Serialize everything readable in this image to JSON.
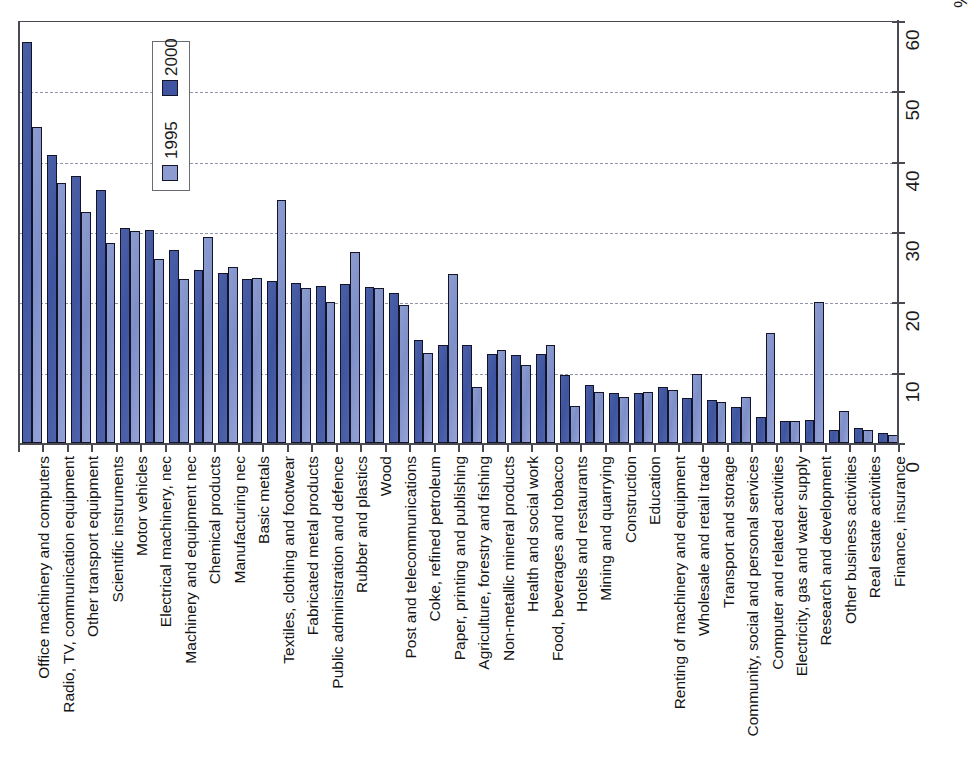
{
  "chart_data": {
    "type": "bar",
    "title": "",
    "xlabel": "",
    "ylabel": "%",
    "unit_label": "%",
    "ylim": [
      0,
      60
    ],
    "yticks": [
      0,
      10,
      20,
      30,
      40,
      50,
      60
    ],
    "grid": true,
    "grid_style": "dashed horizontal gridlines at 10,20,30,40,50",
    "orientation": "vertical bars, rotated page (category labels read bottom-to-top)",
    "legend_position": "inside plot, upper-left area",
    "legend": [
      "2000",
      "1995"
    ],
    "colors": {
      "series_2000": "#3e54a0",
      "series_1995": "#8c9cd0",
      "axis": "#4a4a52",
      "gridline": "#8f94a8",
      "background": "#ffffff"
    },
    "categories": [
      "Office machinery and computers",
      "Radio, TV, communication equipment",
      "Other transport equipment",
      "Scientific instruments",
      "Motor vehicles",
      "Electrical machinery, nec",
      "Machinery and equipment nec",
      "Chemical products",
      "Manufacturing nec",
      "Basic metals",
      "Textiles, clothing and footwear",
      "Fabricated metal products",
      "Public administration and defence",
      "Rubber and plastics",
      "Wood",
      "Post and telecommunications",
      "Coke, refined petroleum",
      "Paper, printing and publishing",
      "Agriculture, forestry and fishing",
      "Non-metallic mineral products",
      "Health and social work",
      "Food, beverages and tobacco",
      "Hotels and restaurants",
      "Mining and quarrying",
      "Construction",
      "Education",
      "Renting of machinery and equipment",
      "Wholesale and retail trade",
      "Transport and storage",
      "Community, social and personal services",
      "Computer and related activities",
      "Electricity, gas and water supply",
      "Research and development",
      "Other business activities",
      "Real estate activities",
      "Finance, insurance"
    ],
    "series": [
      {
        "name": "2000",
        "values": [
          57.0,
          41.0,
          38.0,
          36.0,
          30.6,
          30.3,
          27.5,
          24.6,
          24.2,
          23.3,
          23.0,
          22.7,
          22.3,
          22.6,
          22.2,
          21.3,
          14.7,
          13.9,
          13.9,
          12.7,
          12.5,
          12.6,
          9.7,
          8.2,
          7.1,
          7.1,
          7.9,
          6.4,
          6.1,
          5.1,
          3.7,
          3.2,
          3.3,
          1.8,
          2.2,
          1.4
        ]
      },
      {
        "name": "1995",
        "values": [
          45.0,
          37.0,
          32.8,
          28.4,
          30.2,
          26.2,
          23.3,
          29.3,
          25.0,
          23.4,
          34.6,
          22.0,
          20.0,
          27.2,
          22.1,
          19.6,
          12.8,
          24.0,
          7.9,
          13.2,
          11.1,
          13.9,
          5.2,
          7.3,
          6.5,
          7.2,
          7.6,
          9.8,
          5.9,
          6.5,
          15.6,
          3.1,
          20.0,
          4.5,
          1.9,
          1.1
        ]
      }
    ]
  }
}
